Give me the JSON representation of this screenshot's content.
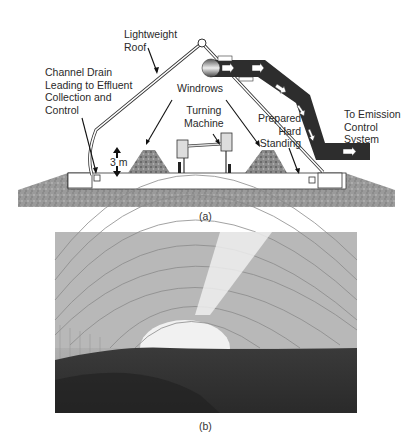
{
  "figure_a": {
    "caption": "(a)",
    "labels": {
      "roof": "Lightweight\nRoof",
      "drain": "Channel Drain\nLeading to Effluent\nCollection and\nControl",
      "windrows": "Windrows",
      "turning_machine": "Turning\nMachine",
      "hard_standing": "Prepared\nHard\nStanding",
      "emission": "To Emission\nControl\nSystem",
      "height": "3 m"
    }
  },
  "figure_b": {
    "caption": "(b)",
    "description": "Interior photograph of a composting hall with arched roof and windrows"
  }
}
